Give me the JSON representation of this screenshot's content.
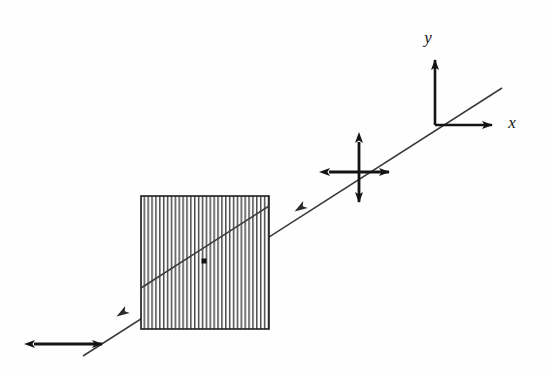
{
  "figure": {
    "background_color": "#fefefe",
    "ink_color": "#141414",
    "ray_color": "#3a3a3a",
    "width": 553,
    "height": 377
  },
  "axes": {
    "origin": {
      "x": 435,
      "y": 125
    },
    "x_axis": {
      "label": "x",
      "label_x": 512,
      "label_y": 122,
      "start_x": 435,
      "start_y": 125,
      "end_x": 497,
      "end_y": 125
    },
    "y_axis": {
      "label": "y",
      "label_x": 428,
      "label_y": 38,
      "start_x": 435,
      "start_y": 125,
      "end_x": 435,
      "end_y": 54
    }
  },
  "ray": {
    "name": "light-ray",
    "start_x": 502,
    "start_y": 88,
    "end_x": 83,
    "end_y": 356,
    "direction": "right-to-left",
    "arrowheads": [
      {
        "x": 300,
        "y": 208
      },
      {
        "x": 122,
        "y": 313
      }
    ]
  },
  "polarizer": {
    "name": "linear-polarizer",
    "left": 141,
    "top": 196,
    "width": 128,
    "height": 133,
    "stripe_count": 33,
    "stripe_orientation": "vertical",
    "center_dot": {
      "x": 204,
      "y": 261,
      "size": 5
    }
  },
  "incident_polarization": {
    "name": "unpolarized-cross-arrows",
    "center_x": 359,
    "center_y": 172,
    "half_length_horizontal": 36,
    "half_length_vertical": 36,
    "description": "four-headed cross = unpolarized light"
  },
  "transmitted_polarization": {
    "name": "horizontal-double-arrow",
    "center_x": 68,
    "center_y": 344,
    "half_length": 40,
    "description": "double-headed horizontal arrow = linearly polarized light"
  }
}
